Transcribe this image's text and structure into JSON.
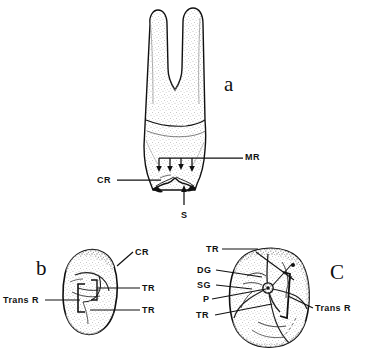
{
  "figure": {
    "style": "black and white stippled line drawing",
    "background_color": "#ffffff",
    "ink_color": "#111111",
    "panels": [
      {
        "id": "a",
        "letter": "a",
        "view": "buccal / lateral view of two-rooted tooth",
        "letter_x": 224,
        "letter_y": 74
      },
      {
        "id": "b",
        "letter": "b",
        "view": "occlusal view, smaller tooth",
        "letter_x": 36,
        "letter_y": 258
      },
      {
        "id": "c",
        "letter": "C",
        "view": "occlusal view, larger tooth",
        "letter_x": 330,
        "letter_y": 262
      }
    ],
    "annotations": [
      {
        "panel": "a",
        "text": "MR",
        "x": 245,
        "y": 157,
        "anchor": "start"
      },
      {
        "panel": "a",
        "text": "CR",
        "x": 114,
        "y": 180,
        "anchor": "end"
      },
      {
        "panel": "a",
        "text": "S",
        "x": 184,
        "y": 215,
        "anchor": "middle"
      },
      {
        "panel": "b",
        "text": "CR",
        "x": 135,
        "y": 252,
        "anchor": "start"
      },
      {
        "panel": "b",
        "text": "TR",
        "x": 142,
        "y": 288,
        "anchor": "start"
      },
      {
        "panel": "b",
        "text": "TR",
        "x": 142,
        "y": 310,
        "anchor": "start"
      },
      {
        "panel": "b",
        "text": "Trans R",
        "x": 42,
        "y": 300,
        "anchor": "end"
      },
      {
        "panel": "c",
        "text": "TR",
        "x": 206,
        "y": 249,
        "anchor": "start"
      },
      {
        "panel": "c",
        "text": "DG",
        "x": 197,
        "y": 270,
        "anchor": "start"
      },
      {
        "panel": "c",
        "text": "SG",
        "x": 197,
        "y": 285,
        "anchor": "start"
      },
      {
        "panel": "c",
        "text": "P",
        "x": 203,
        "y": 299,
        "anchor": "start"
      },
      {
        "panel": "c",
        "text": "TR",
        "x": 196,
        "y": 315,
        "anchor": "start"
      },
      {
        "panel": "c",
        "text": "Trans R",
        "x": 315,
        "y": 308,
        "anchor": "start"
      }
    ],
    "legend_keys": {
      "MR": "marginal ridge",
      "CR": "cusp ridge",
      "S": "sulcus",
      "TR": "triangular ridge",
      "DG": "developmental groove",
      "SG": "supplemental groove",
      "P": "pit",
      "Trans R": "transverse ridge"
    }
  }
}
